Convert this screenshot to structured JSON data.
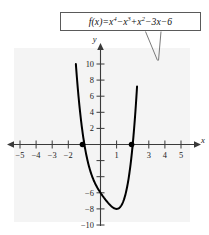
{
  "figure": {
    "title": "",
    "background_color": "#ffffff",
    "plot_background_color": "#f4f4f4"
  },
  "callout": {
    "name": "function-formula",
    "text": "f(x) = x^4 - x^3 + x^2 - 3x - 6",
    "parts": {
      "fx": "f(x)",
      "equals": "=",
      "t1_base": "x",
      "t1_exp": "4",
      "s1": "−",
      "t2_base": "x",
      "t2_exp": "3",
      "s2": "+",
      "t3_base": "x",
      "t3_exp": "2",
      "s3": "−",
      "t4": "3x",
      "s4": "−",
      "t5": "6"
    },
    "border_color": "#5a5a5a",
    "leader_lines": 2
  },
  "axes": {
    "x_label": "x",
    "y_label": "y",
    "x_ticks": [
      {
        "value": -5,
        "label": "−5"
      },
      {
        "value": -4,
        "label": "−4"
      },
      {
        "value": -3,
        "label": "−3"
      },
      {
        "value": -2,
        "label": "−2"
      },
      {
        "value": -1,
        "label": ""
      },
      {
        "value": 1,
        "label": "1"
      },
      {
        "value": 2,
        "label": ""
      },
      {
        "value": 3,
        "label": "3"
      },
      {
        "value": 4,
        "label": "4"
      },
      {
        "value": 5,
        "label": "5"
      }
    ],
    "y_ticks": [
      {
        "value": 10,
        "label": "10"
      },
      {
        "value": 8,
        "label": "8"
      },
      {
        "value": 6,
        "label": "6"
      },
      {
        "value": 4,
        "label": "4"
      },
      {
        "value": 2,
        "label": "2"
      },
      {
        "value": -2,
        "label": ""
      },
      {
        "value": -4,
        "label": ""
      },
      {
        "value": -6,
        "label": "−6"
      },
      {
        "value": -8,
        "label": "−8"
      },
      {
        "value": -10,
        "label": "−10"
      }
    ],
    "xlim": [
      -5.6,
      5.6
    ],
    "ylim": [
      -11.0,
      11.8
    ],
    "axis_color": "#3a3a3a",
    "arrowheads": [
      "x-positive",
      "x-negative",
      "y-positive"
    ]
  },
  "chart_data": {
    "type": "line",
    "xlabel": "x",
    "ylabel": "y",
    "xlim": [
      -5.6,
      5.6
    ],
    "ylim": [
      -11.0,
      11.8
    ],
    "grid": false,
    "legend": "none",
    "function": "x^4 - x^3 + x^2 - 3*x - 6",
    "curve_color": "#000000",
    "x_visible_range": [
      -1.85,
      2.28
    ],
    "x": [
      -1.85,
      -1.75,
      -1.65,
      -1.55,
      -1.45,
      -1.35,
      -1.25,
      -1.15,
      -1.05,
      -0.95,
      -0.85,
      -0.75,
      -0.65,
      -0.55,
      -0.45,
      -0.35,
      -0.25,
      -0.15,
      -0.05,
      0.05,
      0.15,
      0.25,
      0.35,
      0.45,
      0.55,
      0.65,
      0.75,
      0.85,
      0.95,
      1.05,
      1.15,
      1.25,
      1.35,
      1.45,
      1.55,
      1.65,
      1.75,
      1.85,
      1.95,
      2.05,
      2.15,
      2.25
    ],
    "y": [
      21.1,
      17.3,
      14.0,
      11.1,
      8.6,
      6.4,
      4.5,
      2.9,
      1.5,
      0.4,
      -0.6,
      -1.4,
      -2.0,
      -2.6,
      -3.1,
      -3.5,
      -3.9,
      -4.2,
      -4.5,
      -4.8,
      -5.1,
      -5.4,
      -5.7,
      -6.0,
      -6.3,
      -6.5,
      -6.8,
      -7.1,
      -7.3,
      -7.5,
      -7.7,
      -7.8,
      -7.9,
      -7.8,
      -7.6,
      -7.2,
      -6.5,
      -5.5,
      -4.1,
      -2.2,
      0.3,
      3.4
    ],
    "markers": [
      {
        "name": "x-intercept-left",
        "x": -1.12,
        "y": 0
      },
      {
        "name": "x-intercept-right",
        "x": 1.93,
        "y": 0
      }
    ],
    "minimum": {
      "x": 1.18,
      "y": -7.96
    }
  }
}
